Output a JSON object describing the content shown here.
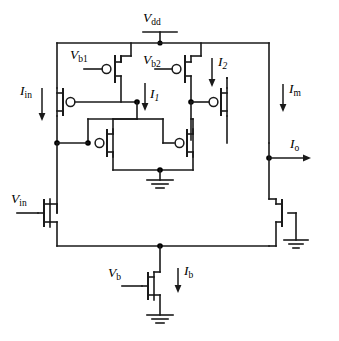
{
  "figure": {
    "type": "circuit-schematic",
    "width": 339,
    "height": 341,
    "line_color": "#1a1a1a",
    "background": "#ffffff"
  },
  "labels": {
    "vdd": {
      "base": "V",
      "sub": "dd",
      "text": "Vdd"
    },
    "vb1": {
      "base": "V",
      "sub": "b1",
      "text": "Vb1"
    },
    "vb2": {
      "base": "V",
      "sub": "b2",
      "text": "Vb2"
    },
    "vb": {
      "base": "V",
      "sub": "b",
      "text": "Vb"
    },
    "vin": {
      "base": "V",
      "sub": "in",
      "text": "Vin"
    },
    "iin": {
      "base": "I",
      "sub": "in",
      "text": "Iin"
    },
    "i1": {
      "base": "I",
      "sub": "1",
      "text": "I1"
    },
    "i2": {
      "base": "I",
      "sub": "2",
      "text": "I2"
    },
    "im": {
      "base": "I",
      "sub": "m",
      "text": "Im"
    },
    "io": {
      "base": "I",
      "sub": "o",
      "text": "Io"
    },
    "ib": {
      "base": "I",
      "sub": "b",
      "text": "Ib"
    }
  },
  "nodes": {
    "supply_rail_label": "Vdd",
    "ground_count": 3,
    "junction_dots": 9
  },
  "devices": [
    {
      "id": "M-left-cascode",
      "type": "pmos",
      "gate_label": null
    },
    {
      "id": "M-vb1",
      "type": "pmos",
      "gate_label": "Vb1"
    },
    {
      "id": "M-vb2",
      "type": "pmos",
      "gate_label": "Vb2"
    },
    {
      "id": "M-right-cascode",
      "type": "pmos",
      "gate_label": null
    },
    {
      "id": "M-mirror-left",
      "type": "pmos",
      "gate_label": null
    },
    {
      "id": "M-mirror-right",
      "type": "pmos",
      "gate_label": null
    },
    {
      "id": "M-vin",
      "type": "nmos",
      "gate_label": "Vin"
    },
    {
      "id": "M-out",
      "type": "nmos",
      "gate_label": null
    },
    {
      "id": "M-vb",
      "type": "nmos",
      "gate_label": "Vb"
    }
  ],
  "currents": [
    {
      "name": "Iin",
      "direction": "down"
    },
    {
      "name": "I1",
      "direction": "down"
    },
    {
      "name": "I2",
      "direction": "down"
    },
    {
      "name": "Im",
      "direction": "down"
    },
    {
      "name": "Io",
      "direction": "right"
    },
    {
      "name": "Ib",
      "direction": "down"
    }
  ]
}
